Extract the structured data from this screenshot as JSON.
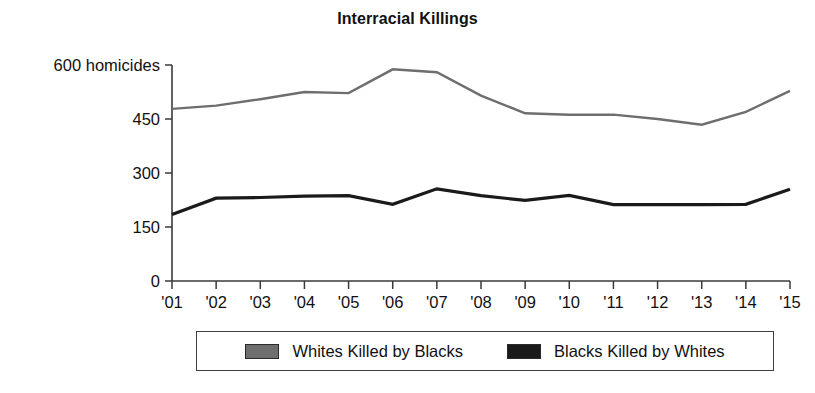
{
  "chart_data": {
    "type": "line",
    "title": "Interracial Killings",
    "xlabel": "",
    "ylabel": "",
    "ylim": [
      0,
      600
    ],
    "yticks": [
      0,
      150,
      300,
      450,
      600
    ],
    "ytick_labels": [
      "0",
      "150",
      "300",
      "450",
      "600 homicides"
    ],
    "y_unit_label": "homicides",
    "grid": false,
    "legend_position": "bottom",
    "categories": [
      "'01",
      "'02",
      "'03",
      "'04",
      "'05",
      "'06",
      "'07",
      "'08",
      "'09",
      "'10",
      "'11",
      "'12",
      "'13",
      "'14",
      "'15"
    ],
    "series": [
      {
        "name": "Whites Killed by Blacks",
        "color": "#6e6e6e",
        "values": [
          478,
          487,
          505,
          525,
          522,
          588,
          580,
          515,
          466,
          462,
          462,
          450,
          434,
          470,
          528
        ]
      },
      {
        "name": "Blacks Killed by Whites",
        "color": "#1a1a1a",
        "values": [
          185,
          230,
          232,
          236,
          237,
          213,
          256,
          237,
          224,
          238,
          212,
          212,
          212,
          213,
          255
        ]
      }
    ]
  },
  "legend": {
    "entries": [
      {
        "label": "Whites Killed by Blacks",
        "color": "#6e6e6e"
      },
      {
        "label": "Blacks Killed by Whites",
        "color": "#1a1a1a"
      }
    ]
  }
}
